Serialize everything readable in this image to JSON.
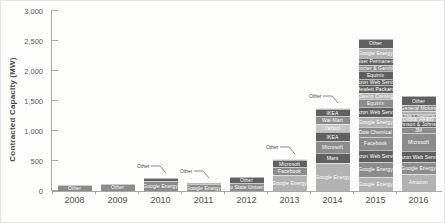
{
  "chart_data": {
    "type": "bar",
    "stacked": true,
    "title": "",
    "xlabel": "",
    "ylabel": "Contracted Capacity (MW)",
    "ylim": [
      0,
      3000
    ],
    "grid": false,
    "legend": "none (labels inside segments)",
    "yticks": [
      {
        "value": 0,
        "label": "0"
      },
      {
        "value": 500,
        "label": "500"
      },
      {
        "value": 1000,
        "label": "1,000"
      },
      {
        "value": 1500,
        "label": "1,500"
      },
      {
        "value": 2000,
        "label": "2,000"
      },
      {
        "value": 2500,
        "label": "2,500"
      },
      {
        "value": 3000,
        "label": "3,000"
      }
    ],
    "shades": {
      "dark": "#606060",
      "mid": "#8c8c8c",
      "light": "#b2b2b2",
      "xlight": "#c6c6c6"
    },
    "categories": [
      "2008",
      "2009",
      "2010",
      "2011",
      "2012",
      "2013",
      "2014",
      "2015",
      "2016"
    ],
    "bars": [
      {
        "year": "2008",
        "total": 100,
        "callout": null,
        "segments": [
          {
            "label": "Other",
            "value": 100,
            "shade": "mid"
          }
        ]
      },
      {
        "year": "2009",
        "total": 120,
        "callout": null,
        "segments": [
          {
            "label": "Other",
            "value": 120,
            "shade": "mid"
          }
        ]
      },
      {
        "year": "2010",
        "total": 220,
        "callout": "Other",
        "segments": [
          {
            "label": "Other",
            "value": 45,
            "shade": "dark",
            "hide_label": true
          },
          {
            "label": "Google Energy",
            "value": 175,
            "shade": "mid"
          }
        ]
      },
      {
        "year": "2011",
        "total": 140,
        "callout": "Other",
        "segments": [
          {
            "label": "Other",
            "value": 30,
            "shade": "dark",
            "hide_label": true
          },
          {
            "label": "Google Energy",
            "value": 110,
            "shade": "mid"
          }
        ]
      },
      {
        "year": "2012",
        "total": 240,
        "callout": null,
        "segments": [
          {
            "label": "Other",
            "value": 110,
            "shade": "dark"
          },
          {
            "label": "Ohio State University",
            "value": 130,
            "shade": "mid"
          }
        ]
      },
      {
        "year": "2013",
        "total": 540,
        "callout": "Other",
        "segments": [
          {
            "label": "Other",
            "value": 30,
            "shade": "xlight",
            "hide_label": true
          },
          {
            "label": "Microsoft",
            "value": 110,
            "shade": "dark"
          },
          {
            "label": "Facebook",
            "value": 130,
            "shade": "mid"
          },
          {
            "label": "Google Energy",
            "value": 270,
            "shade": "light"
          }
        ]
      },
      {
        "year": "2014",
        "total": 1390,
        "callout": "Other",
        "segments": [
          {
            "label": "Other",
            "value": 30,
            "shade": "xlight",
            "hide_label": true
          },
          {
            "label": "IKEA",
            "value": 110,
            "shade": "dark"
          },
          {
            "label": "Wal-Mart",
            "value": 125,
            "shade": "mid"
          },
          {
            "label": "Yahoo!",
            "value": 140,
            "shade": "xlight"
          },
          {
            "label": "IKEA",
            "value": 160,
            "shade": "dark"
          },
          {
            "label": "Microsoft",
            "value": 190,
            "shade": "mid"
          },
          {
            "label": "Mars",
            "value": 175,
            "shade": "dark"
          },
          {
            "label": "Google Energy",
            "value": 460,
            "shade": "light"
          }
        ]
      },
      {
        "year": "2015",
        "total": 2535,
        "callout": null,
        "segments": [
          {
            "label": "Other",
            "value": 145,
            "shade": "dark"
          },
          {
            "label": "Google Energy",
            "value": 175,
            "shade": "light"
          },
          {
            "label": "Kaiser Permanente",
            "value": 110,
            "shade": "dark"
          },
          {
            "label": "Procter & Gamble",
            "value": 110,
            "shade": "mid"
          },
          {
            "label": "Equinix",
            "value": 125,
            "shade": "dark"
          },
          {
            "label": "Amazon Web Services",
            "value": 110,
            "shade": "dark"
          },
          {
            "label": "Hewlett Packard",
            "value": 125,
            "shade": "dark"
          },
          {
            "label": "Owens Corning",
            "value": 110,
            "shade": "light"
          },
          {
            "label": "Equinix",
            "value": 125,
            "shade": "mid"
          },
          {
            "label": "Amazon Web Services",
            "value": 160,
            "shade": "dark"
          },
          {
            "label": "Google Energy",
            "value": 175,
            "shade": "light"
          },
          {
            "label": "Dow Chemical",
            "value": 160,
            "shade": "mid"
          },
          {
            "label": "Facebook",
            "value": 220,
            "shade": "mid"
          },
          {
            "label": "Amazon Web Services",
            "value": 205,
            "shade": "dark"
          },
          {
            "label": "Google Energy",
            "value": 240,
            "shade": "mid"
          },
          {
            "label": "Google Energy",
            "value": 240,
            "shade": "light"
          }
        ]
      },
      {
        "year": "2016",
        "total": 1580,
        "callout": null,
        "segments": [
          {
            "label": "Other",
            "value": 145,
            "shade": "dark"
          },
          {
            "label": "General Motors",
            "value": 110,
            "shade": "mid"
          },
          {
            "label": "Iron Mountain",
            "value": 45,
            "shade": "light"
          },
          {
            "label": "Dow Chemical",
            "value": 55,
            "shade": "mid"
          },
          {
            "label": "Digital Realty",
            "value": 55,
            "shade": "light"
          },
          {
            "label": "Johnson & Johnson",
            "value": 110,
            "shade": "dark"
          },
          {
            "label": "3M",
            "value": 95,
            "shade": "mid"
          },
          {
            "label": "Microsoft",
            "value": 300,
            "shade": "mid"
          },
          {
            "label": "Amazon Web Services",
            "value": 190,
            "shade": "dark"
          },
          {
            "label": "Google Energy",
            "value": 190,
            "shade": "mid"
          },
          {
            "label": "Amazon",
            "value": 285,
            "shade": "light"
          }
        ]
      }
    ]
  }
}
